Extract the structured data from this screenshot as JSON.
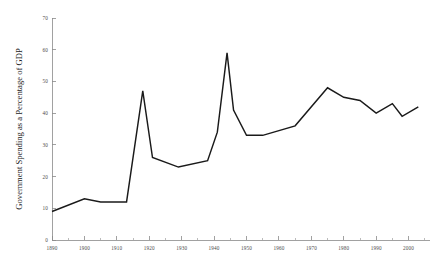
{
  "chart_data": {
    "type": "line",
    "title": "",
    "subtitle": "",
    "xlabel": "",
    "ylabel": "Government Spending as a Percentage of GDP",
    "xlim": [
      1890,
      2005
    ],
    "ylim": [
      0,
      70
    ],
    "grid": false,
    "legend": null,
    "legend_position": "none",
    "x_ticks": [
      1890,
      1900,
      1910,
      1920,
      1930,
      1940,
      1950,
      1960,
      1970,
      1980,
      1990,
      2000
    ],
    "x_tick_labels": [
      "1890",
      "1900",
      "1910",
      "1920",
      "1930",
      "1940",
      "1950",
      "1960",
      "1970",
      "1980",
      "1990",
      "2000"
    ],
    "y_ticks": [
      0,
      10,
      20,
      30,
      40,
      50,
      60,
      70
    ],
    "y_tick_labels": [
      "0",
      "10",
      "20",
      "30",
      "40",
      "50",
      "60",
      "70"
    ],
    "series": [
      {
        "name": "Government Spending as a Percentage of GDP",
        "color": "#1a1a1a",
        "x": [
          1890,
          1900,
          1905,
          1913,
          1918,
          1921,
          1929,
          1938,
          1941,
          1944,
          1946,
          1950,
          1955,
          1965,
          1975,
          1980,
          1985,
          1990,
          1995,
          1998,
          2003
        ],
        "values": [
          9,
          13,
          12,
          12,
          47,
          26,
          23,
          25,
          34,
          59,
          41,
          33,
          33,
          36,
          48,
          45,
          44,
          40,
          43,
          39,
          42
        ]
      }
    ],
    "annotations": []
  },
  "axis_style": {
    "axis_color": "#8a8a8a",
    "line_color": "#1a1a1a",
    "background": "#ffffff"
  }
}
